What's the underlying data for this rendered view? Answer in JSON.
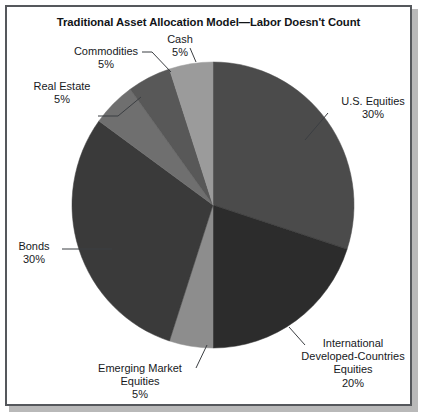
{
  "figure": {
    "title": "Traditional Asset Allocation Model—Labor Doesn't Count",
    "border_color": "#55585c",
    "background": "#ffffff"
  },
  "chart_data": {
    "type": "pie",
    "title": "Traditional Asset Allocation Model—Labor Doesn't Count",
    "xlabel": "",
    "ylabel": "",
    "units": "percent",
    "total": 100,
    "start_angle_deg": 0,
    "direction": "clockwise",
    "legend": "none (direct labels with leader lines)",
    "grid": false,
    "categories": [
      "U.S. Equities",
      "International Developed-Countries Equities",
      "Emerging Market Equities",
      "Bonds",
      "Real Estate",
      "Commodities",
      "Cash"
    ],
    "values": [
      30,
      20,
      5,
      30,
      5,
      5,
      5
    ],
    "colors": [
      "#4b4b4b",
      "#2c2c2c",
      "#8d8d8d",
      "#3a3a3a",
      "#6f6f6f",
      "#585858",
      "#9b9b9b"
    ],
    "slices": [
      {
        "label": "U.S. Equities",
        "value": 30,
        "value_text": "30%",
        "color": "#4b4b4b"
      },
      {
        "label": "International Developed-Countries Equities",
        "value": 20,
        "value_text": "20%",
        "color": "#2c2c2c"
      },
      {
        "label": "Emerging Market Equities",
        "value": 5,
        "value_text": "5%",
        "color": "#8d8d8d"
      },
      {
        "label": "Bonds",
        "value": 30,
        "value_text": "30%",
        "color": "#3a3a3a"
      },
      {
        "label": "Real Estate",
        "value": 5,
        "value_text": "5%",
        "color": "#6f6f6f"
      },
      {
        "label": "Commodities",
        "value": 5,
        "value_text": "5%",
        "color": "#585858"
      },
      {
        "label": "Cash",
        "value": 5,
        "value_text": "5%",
        "color": "#9b9b9b"
      }
    ]
  },
  "labels": {
    "cash": {
      "name": "Cash",
      "pct": "5%"
    },
    "commodities": {
      "name": "Commodities",
      "pct": "5%"
    },
    "real_estate": {
      "name": "Real Estate",
      "pct": "5%"
    },
    "us_equities": {
      "name": "U.S. Equities",
      "pct": "30%"
    },
    "bonds": {
      "name": "Bonds",
      "pct": "30%"
    },
    "international": {
      "line1": "International",
      "line2": "Developed-Countries",
      "line3": "Equities",
      "pct": "20%"
    },
    "emerging": {
      "line1": "Emerging Market",
      "line2": "Equities",
      "pct": "5%"
    }
  }
}
